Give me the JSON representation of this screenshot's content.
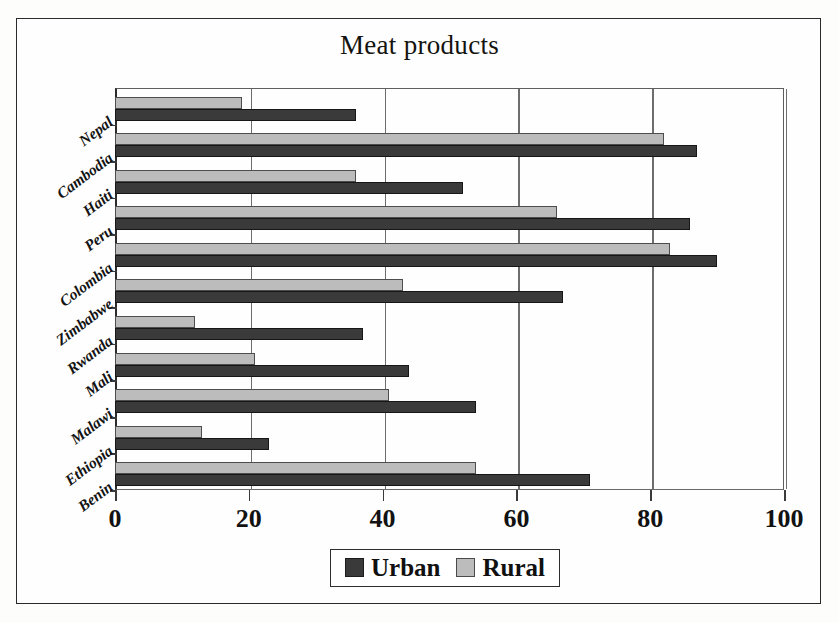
{
  "chart_data": {
    "type": "bar",
    "orientation": "horizontal",
    "title": "Meat products",
    "xlabel": "",
    "ylabel": "",
    "xlim": [
      0,
      100
    ],
    "xticks": [
      0,
      20,
      40,
      60,
      80,
      100
    ],
    "xtick_labels": [
      "0",
      "20",
      "40",
      "60",
      "80",
      "100"
    ],
    "grid": true,
    "grid_axis": "x",
    "legend_position": "bottom-center",
    "categories": [
      "Nepal",
      "Cambodia",
      "Haiti",
      "Peru",
      "Colombia",
      "Zimbabwe",
      "Rwanda",
      "Mali",
      "Malawi",
      "Ethiopia",
      "Benin"
    ],
    "series": [
      {
        "name": "Urban",
        "color": "#3a3a3a",
        "values": [
          36,
          87,
          52,
          86,
          90,
          67,
          37,
          44,
          54,
          23,
          71
        ]
      },
      {
        "name": "Rural",
        "color": "#bcbcbc",
        "values": [
          19,
          82,
          36,
          66,
          83,
          43,
          12,
          21,
          41,
          13,
          54
        ]
      }
    ]
  },
  "legend": {
    "entries": [
      {
        "label": "Urban",
        "swatch": "urban"
      },
      {
        "label": "Rural",
        "swatch": "rural"
      }
    ]
  }
}
